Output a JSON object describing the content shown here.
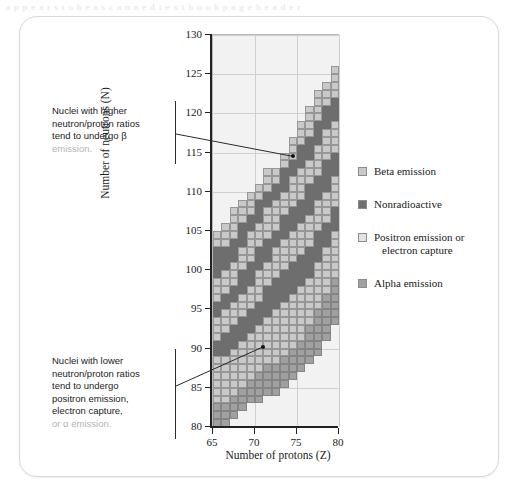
{
  "scan": {
    "top_text": "a p p e a r s   t o   b e   a   s c a n n e d   t e x t b o o k   p a g e   h e a d e r"
  },
  "figure": {
    "x_axis_title": "Number of protons (Z)",
    "y_axis_title": "Number of neutrons (N)"
  },
  "annotations": [
    {
      "id": "higher-ratio",
      "line1": "Nuclei with higher",
      "line2": "neutron/proton ratios",
      "line3": "tend to undergo β",
      "line4": "emission.",
      "target_z": 74.6,
      "target_n": 114.4
    },
    {
      "id": "lower-ratio",
      "line1": "Nuclei with lower",
      "line2": "neutron/proton ratios",
      "line3": "tend to undergo",
      "line4": "positron emission,",
      "line5": "electron capture,",
      "line6": "or α emission.",
      "target_z": 71.1,
      "target_n": 90.1
    }
  ],
  "legend": {
    "items": [
      {
        "key": "beta",
        "label": "Beta emission",
        "label2": "",
        "color": "#c9c9c9"
      },
      {
        "key": "stable",
        "label": "Nonradioactive",
        "label2": "",
        "color": "#6e6e6e"
      },
      {
        "key": "pos",
        "label": "Positron emission or",
        "label2": "electron capture",
        "color": "#e3e3e3"
      },
      {
        "key": "alpha",
        "label": "Alpha emission",
        "label2": "",
        "color": "#a0a0a0"
      }
    ]
  },
  "chart_data": {
    "type": "heatmap",
    "title": "",
    "xlabel": "Number of protons (Z)",
    "ylabel": "Number of neutrons (N)",
    "xlim": [
      65,
      80
    ],
    "ylim": [
      80,
      130
    ],
    "xticks": [
      65,
      70,
      75,
      80
    ],
    "yticks": [
      80,
      85,
      90,
      95,
      100,
      105,
      110,
      115,
      120,
      125,
      130
    ],
    "grid": true,
    "legend_position": "right",
    "cell_size": {
      "z": 1,
      "n": 1
    },
    "categories": [
      {
        "key": "beta",
        "name": "Beta emission",
        "color": "#c9c9c9"
      },
      {
        "key": "stable",
        "name": "Nonradioactive",
        "color": "#6e6e6e"
      },
      {
        "key": "pos",
        "name": "Positron emission or electron capture",
        "color": "#e3e3e3"
      },
      {
        "key": "alpha",
        "name": "Alpha emission",
        "color": "#a0a0a0"
      }
    ],
    "note": "columns[] gives one entry per proton number Z; runs are [startN, endN, category] inclusive of startN and exclusive of endN",
    "columns": [
      {
        "z": 65,
        "runs": [
          [
            80,
            83,
            "alpha"
          ],
          [
            83,
            89,
            "beta"
          ],
          [
            89,
            91,
            "stable"
          ],
          [
            91,
            94,
            "beta"
          ],
          [
            94,
            96,
            "stable"
          ],
          [
            96,
            99,
            "beta"
          ],
          [
            99,
            103,
            "stable"
          ],
          [
            103,
            105,
            "beta"
          ]
        ]
      },
      {
        "z": 66,
        "runs": [
          [
            80,
            83,
            "alpha"
          ],
          [
            83,
            89,
            "beta"
          ],
          [
            89,
            92,
            "stable"
          ],
          [
            92,
            95,
            "beta"
          ],
          [
            95,
            97,
            "stable"
          ],
          [
            97,
            100,
            "beta"
          ],
          [
            100,
            103,
            "stable"
          ],
          [
            103,
            106,
            "beta"
          ]
        ]
      },
      {
        "z": 67,
        "runs": [
          [
            81,
            84,
            "alpha"
          ],
          [
            84,
            90,
            "beta"
          ],
          [
            90,
            93,
            "stable"
          ],
          [
            93,
            96,
            "beta"
          ],
          [
            96,
            98,
            "stable"
          ],
          [
            98,
            101,
            "beta"
          ],
          [
            101,
            104,
            "stable"
          ],
          [
            104,
            108,
            "beta"
          ]
        ]
      },
      {
        "z": 68,
        "runs": [
          [
            82,
            85,
            "alpha"
          ],
          [
            85,
            91,
            "beta"
          ],
          [
            91,
            94,
            "stable"
          ],
          [
            94,
            97,
            "beta"
          ],
          [
            97,
            100,
            "stable"
          ],
          [
            100,
            103,
            "beta"
          ],
          [
            103,
            106,
            "stable"
          ],
          [
            106,
            109,
            "beta"
          ]
        ]
      },
      {
        "z": 69,
        "runs": [
          [
            83,
            86,
            "alpha"
          ],
          [
            86,
            92,
            "beta"
          ],
          [
            92,
            95,
            "stable"
          ],
          [
            95,
            98,
            "beta"
          ],
          [
            98,
            101,
            "stable"
          ],
          [
            101,
            105,
            "beta"
          ],
          [
            105,
            107,
            "stable"
          ],
          [
            107,
            110,
            "beta"
          ]
        ]
      },
      {
        "z": 70,
        "runs": [
          [
            83,
            87,
            "alpha"
          ],
          [
            87,
            93,
            "beta"
          ],
          [
            93,
            96,
            "stable"
          ],
          [
            96,
            100,
            "beta"
          ],
          [
            100,
            103,
            "stable"
          ],
          [
            103,
            106,
            "beta"
          ],
          [
            106,
            109,
            "stable"
          ],
          [
            109,
            111,
            "beta"
          ]
        ]
      },
      {
        "z": 71,
        "runs": [
          [
            84,
            88,
            "alpha"
          ],
          [
            88,
            94,
            "beta"
          ],
          [
            94,
            98,
            "stable"
          ],
          [
            98,
            101,
            "beta"
          ],
          [
            101,
            104,
            "stable"
          ],
          [
            104,
            108,
            "beta"
          ],
          [
            108,
            110,
            "stable"
          ],
          [
            110,
            113,
            "beta"
          ]
        ]
      },
      {
        "z": 72,
        "runs": [
          [
            84,
            88,
            "alpha"
          ],
          [
            88,
            95,
            "beta"
          ],
          [
            95,
            99,
            "stable"
          ],
          [
            99,
            103,
            "beta"
          ],
          [
            103,
            105,
            "stable"
          ],
          [
            105,
            109,
            "beta"
          ],
          [
            109,
            111,
            "stable"
          ],
          [
            111,
            113,
            "beta"
          ]
        ]
      },
      {
        "z": 73,
        "runs": [
          [
            85,
            89,
            "alpha"
          ],
          [
            89,
            96,
            "beta"
          ],
          [
            96,
            100,
            "stable"
          ],
          [
            100,
            104,
            "beta"
          ],
          [
            104,
            107,
            "stable"
          ],
          [
            107,
            110,
            "beta"
          ],
          [
            110,
            113,
            "stable"
          ],
          [
            113,
            115,
            "beta"
          ]
        ]
      },
      {
        "z": 74,
        "runs": [
          [
            86,
            90,
            "alpha"
          ],
          [
            90,
            97,
            "beta"
          ],
          [
            97,
            101,
            "stable"
          ],
          [
            101,
            105,
            "beta"
          ],
          [
            105,
            108,
            "stable"
          ],
          [
            108,
            112,
            "beta"
          ],
          [
            112,
            114,
            "stable"
          ],
          [
            114,
            117,
            "beta"
          ]
        ]
      },
      {
        "z": 75,
        "runs": [
          [
            87,
            91,
            "alpha"
          ],
          [
            91,
            98,
            "beta"
          ],
          [
            98,
            102,
            "stable"
          ],
          [
            102,
            106,
            "beta"
          ],
          [
            106,
            109,
            "stable"
          ],
          [
            109,
            113,
            "beta"
          ],
          [
            113,
            116,
            "stable"
          ],
          [
            116,
            119,
            "beta"
          ]
        ]
      },
      {
        "z": 76,
        "runs": [
          [
            88,
            93,
            "alpha"
          ],
          [
            93,
            99,
            "beta"
          ],
          [
            99,
            103,
            "stable"
          ],
          [
            103,
            107,
            "beta"
          ],
          [
            107,
            111,
            "stable"
          ],
          [
            111,
            114,
            "beta"
          ],
          [
            114,
            117,
            "stable"
          ],
          [
            117,
            121,
            "beta"
          ]
        ]
      },
      {
        "z": 77,
        "runs": [
          [
            89,
            95,
            "alpha"
          ],
          [
            95,
            101,
            "beta"
          ],
          [
            101,
            105,
            "stable"
          ],
          [
            105,
            109,
            "beta"
          ],
          [
            109,
            112,
            "stable"
          ],
          [
            112,
            116,
            "beta"
          ],
          [
            116,
            119,
            "stable"
          ],
          [
            119,
            123,
            "beta"
          ]
        ]
      },
      {
        "z": 78,
        "runs": [
          [
            91,
            97,
            "alpha"
          ],
          [
            97,
            103,
            "beta"
          ],
          [
            103,
            106,
            "stable"
          ],
          [
            106,
            110,
            "beta"
          ],
          [
            110,
            114,
            "stable"
          ],
          [
            114,
            118,
            "beta"
          ],
          [
            118,
            121,
            "stable"
          ],
          [
            121,
            124,
            "beta"
          ]
        ]
      },
      {
        "z": 79,
        "runs": [
          [
            93,
            99,
            "alpha"
          ],
          [
            99,
            105,
            "beta"
          ],
          [
            105,
            108,
            "stable"
          ],
          [
            108,
            112,
            "beta"
          ],
          [
            112,
            115,
            "stable"
          ],
          [
            115,
            119,
            "beta"
          ],
          [
            119,
            122,
            "stable"
          ],
          [
            122,
            126,
            "beta"
          ]
        ]
      }
    ]
  }
}
